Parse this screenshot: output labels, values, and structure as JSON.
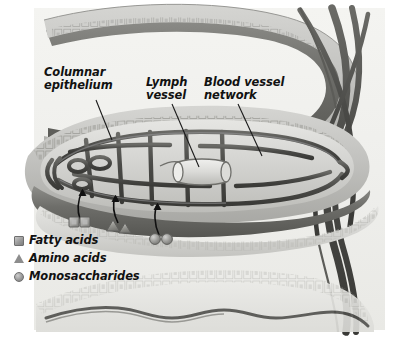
{
  "figure": {
    "background_color": "#ffffff",
    "plate_color": "#f2f2ef",
    "ink_color": "#111111"
  },
  "labels": [
    {
      "id": "columnar-epithelium",
      "line1": "Columnar",
      "line2": "epithelium",
      "x": 44,
      "y": 72
    },
    {
      "id": "lymph-vessel",
      "line1": "Lymph",
      "line2": "vessel",
      "x": 146,
      "y": 82
    },
    {
      "id": "blood-vessel-network",
      "line1": "Blood vessel",
      "line2": "network",
      "x": 204,
      "y": 82
    }
  ],
  "leader_lines": [
    {
      "id": "leader-columnar-epithelium",
      "x1": 96,
      "y1": 100,
      "x2": 112,
      "y2": 140
    },
    {
      "id": "leader-lymph-vessel",
      "x1": 172,
      "y1": 104,
      "x2": 199,
      "y2": 167
    },
    {
      "id": "leader-blood-vessel-network",
      "x1": 238,
      "y1": 104,
      "x2": 262,
      "y2": 156
    }
  ],
  "legend": {
    "items": [
      {
        "id": "fatty-acids",
        "icon": "square-swatch",
        "label": "Fatty acids",
        "color": "#9a9a9a",
        "x": 14,
        "y": 234
      },
      {
        "id": "amino-acids",
        "icon": "triangle-swatch",
        "label": "Amino acids",
        "color": "#8d8d8d",
        "x": 14,
        "y": 252
      },
      {
        "id": "monosaccharides",
        "icon": "circle-swatch",
        "label": "Monosaccharides",
        "color": "#9b9b9b",
        "x": 14,
        "y": 270
      }
    ]
  },
  "molecule_groups": [
    {
      "id": "fatty-acid-molecules",
      "shape": "square",
      "count": 2,
      "positions": [
        [
          74,
          222
        ],
        [
          85,
          222
        ]
      ],
      "arrow": {
        "from_x": 80,
        "from_y": 218,
        "to_x": 81,
        "to_y": 190
      }
    },
    {
      "id": "amino-acid-molecules",
      "shape": "triangle",
      "count": 2,
      "positions": [
        [
          113,
          226
        ],
        [
          124,
          228
        ]
      ],
      "arrow": {
        "from_x": 117,
        "from_y": 222,
        "to_x": 115,
        "to_y": 196
      }
    },
    {
      "id": "monosaccharide-molecules",
      "shape": "circle",
      "count": 2,
      "positions": [
        [
          154,
          238
        ],
        [
          166,
          238
        ]
      ],
      "arrow": {
        "from_x": 158,
        "from_y": 234,
        "to_x": 157,
        "to_y": 204
      }
    }
  ],
  "structures": [
    {
      "id": "upper-villus",
      "description": "Upper intestinal villus fold with columnar epithelium border"
    },
    {
      "id": "main-villus",
      "description": "Central villus in cross-section with capillary network and central lacteal"
    },
    {
      "id": "lower-villus",
      "description": "Lower intestinal villus fold, faded, with wavy internal vessel"
    },
    {
      "id": "blood-vessel-trunks",
      "description": "Large crossing blood vessel trunks on the right margin"
    },
    {
      "id": "capillary-mesh",
      "description": "Mesh of capillary loops filling the villus core"
    },
    {
      "id": "lacteal",
      "description": "Central lymph lacteal tube inside the villus core"
    }
  ]
}
